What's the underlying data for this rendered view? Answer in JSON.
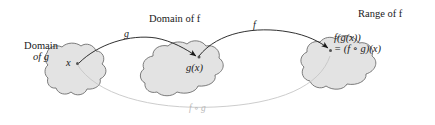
{
  "figure": {
    "type": "function-composition-diagram",
    "background": "#ffffff",
    "blob_fill": "#e3e3e3",
    "blob_stroke": "#6e6e6e",
    "arrow_color": "#1a1a1a",
    "composite_color": "#bdbdbd"
  },
  "labels": {
    "domain_of_g_line1": "Domain",
    "domain_of_g_line2": "of g",
    "domain_of_f": "Domain of f",
    "range_of_f": "Range of f"
  },
  "points": {
    "x": "x",
    "gx": "g(x)",
    "fgx_line1": "f(g(x))",
    "fgx_line2": "= (f ∘ g)(x)"
  },
  "arrows": {
    "g_label": "g",
    "f_label": "f",
    "composite_label": "f ∘ g"
  }
}
